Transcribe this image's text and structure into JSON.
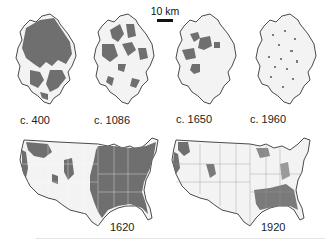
{
  "figure": {
    "scale_bar": {
      "label": "10 km"
    },
    "regional_maps": [
      {
        "label": "c. 400",
        "forest_fraction": 0.75
      },
      {
        "label": "c. 1086",
        "forest_fraction": 0.4
      },
      {
        "label": "c. 1650",
        "forest_fraction": 0.15
      },
      {
        "label": "c. 1960",
        "forest_fraction": 0.02
      }
    ],
    "us_maps": [
      {
        "label": "1620",
        "forest_fraction": 0.5
      },
      {
        "label": "1920",
        "forest_fraction": 0.2
      }
    ],
    "colors": {
      "forest": "#6f6f6f",
      "land": "#f3f3f3",
      "outline": "#4a4a4a",
      "background": "#ffffff"
    }
  }
}
